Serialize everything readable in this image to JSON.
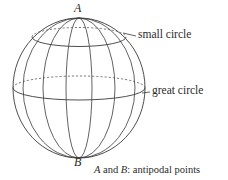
{
  "figure": {
    "type": "sphere-diagram",
    "title_caption": "A and B: antipodal points",
    "caption_parts": {
      "a": "A",
      "and": " and ",
      "b": "B",
      "rest": ": antipodal points"
    },
    "poles": {
      "top_label": "A",
      "bottom_label": "B"
    },
    "annotations": [
      {
        "id": "small-circle",
        "label": "small circle"
      },
      {
        "id": "great-circle",
        "label": "great circle"
      }
    ],
    "colors": {
      "stroke": "#3a3a3a",
      "dashed_stroke": "#5a5a5a",
      "background": "#ffffff",
      "text": "#2b2b2b"
    },
    "geometry": {
      "center_x": 79,
      "center_y": 88,
      "radius_x": 66,
      "radius_y": 70,
      "meridian_count": 6,
      "small_circle_y": 37,
      "great_circle_y": 88
    }
  }
}
